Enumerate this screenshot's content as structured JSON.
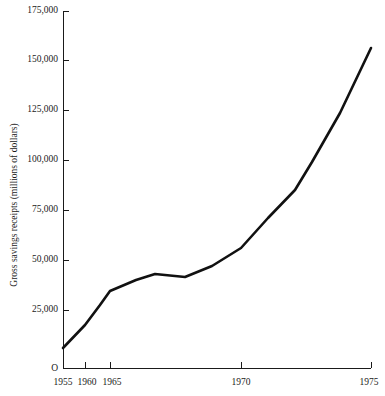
{
  "chart_data": {
    "type": "line",
    "title": "",
    "xlabel": "",
    "ylabel": "Gross savings receipts (millions of dollars)",
    "origin_label": "O",
    "grid": false,
    "legend": false,
    "xlim": [
      1955,
      1975
    ],
    "ylim": [
      0,
      175000
    ],
    "x_tick_labels": [
      "1955",
      "1960",
      "1965",
      "1970",
      "1975"
    ],
    "x_ticks": [
      1955,
      1960,
      1965,
      1970,
      1975
    ],
    "y_tick_labels": [
      "25,000",
      "50,000",
      "75,000",
      "100,000",
      "125,000",
      "150,000",
      "175,000"
    ],
    "y_ticks": [
      25000,
      50000,
      75000,
      100000,
      125000,
      150000,
      175000
    ],
    "axis_note": "x-axis uses compressed non-linear spacing: 1955-1965 occupy a narrow band at left, 1965-1975 span the remaining width",
    "series": [
      {
        "name": "Gross savings receipts",
        "color": "#111111",
        "x": [
          1955,
          1960,
          1963,
          1965,
          1967,
          1968,
          1969,
          1970,
          1971,
          1972,
          1973,
          1974,
          1975
        ],
        "values": [
          13000,
          24000,
          32000,
          38500,
          47000,
          46500,
          51000,
          58000,
          70000,
          82000,
          95000,
          125000,
          155000
        ]
      }
    ]
  },
  "pixel_geometry": {
    "axis_x": 63,
    "axis_y_baseline": 368,
    "axis_y_top": 11,
    "axis_x_right": 371,
    "x_tick_px": [
      63,
      85,
      110,
      241,
      371
    ],
    "y_tick_px": [
      310,
      260,
      210,
      160,
      110,
      60,
      11
    ],
    "series_px": [
      [
        63,
        348
      ],
      [
        85,
        325
      ],
      [
        100,
        305
      ],
      [
        110,
        291
      ],
      [
        136,
        280
      ],
      [
        155,
        274
      ],
      [
        185,
        277
      ],
      [
        212,
        266
      ],
      [
        241,
        248
      ],
      [
        268,
        218
      ],
      [
        295,
        190
      ],
      [
        312,
        162
      ],
      [
        340,
        113
      ],
      [
        371,
        48
      ]
    ]
  }
}
